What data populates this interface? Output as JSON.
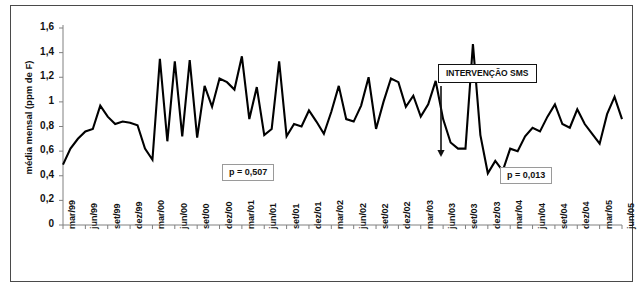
{
  "chart_data": {
    "type": "line",
    "title": "",
    "xlabel": "",
    "ylabel": "média mensal (ppm de F)",
    "ylim": [
      0,
      1.6
    ],
    "ytick_labels": [
      "0",
      "0,2",
      "0,4",
      "0,6",
      "0,8",
      "1",
      "1,2",
      "1,4",
      "1,6"
    ],
    "ytick_values": [
      0,
      0.2,
      0.4,
      0.6,
      0.8,
      1.0,
      1.2,
      1.4,
      1.6
    ],
    "grid": false,
    "legend": "none",
    "x_start": "mar/99",
    "x_end": "jun/05",
    "x_interval": "monthly",
    "tick_labels": [
      "mar/99",
      "jun/99",
      "set/99",
      "dez/99",
      "mar/00",
      "jun/00",
      "set/00",
      "dez/00",
      "mar/01",
      "jun/01",
      "set/01",
      "dez/01",
      "mar/02",
      "jun/02",
      "set/02",
      "dez/02",
      "mar/03",
      "jun/03",
      "set/03",
      "dez/03",
      "mar/04",
      "jun/04",
      "set/04",
      "dez/04",
      "mar/05",
      "jun/05"
    ],
    "series": [
      {
        "name": "média mensal (ppm de F)",
        "values": [
          0.49,
          0.62,
          0.7,
          0.76,
          0.78,
          0.97,
          0.88,
          0.82,
          0.84,
          0.83,
          0.81,
          0.62,
          0.53,
          1.35,
          0.68,
          1.33,
          0.72,
          1.34,
          0.71,
          1.13,
          0.96,
          1.19,
          1.16,
          1.1,
          1.37,
          0.86,
          1.12,
          0.73,
          0.78,
          1.33,
          0.72,
          0.82,
          0.8,
          0.93,
          0.84,
          0.74,
          0.92,
          1.13,
          0.86,
          0.84,
          0.97,
          1.2,
          0.78,
          1.0,
          1.19,
          1.16,
          0.96,
          1.05,
          0.88,
          0.98,
          1.17,
          0.86,
          0.67,
          0.62,
          0.62,
          1.47,
          0.73,
          0.42,
          0.52,
          0.44,
          0.62,
          0.6,
          0.72,
          0.79,
          0.76,
          0.88,
          0.98,
          0.82,
          0.79,
          0.94,
          0.82,
          0.74,
          0.66,
          0.9,
          1.04,
          0.86
        ]
      }
    ],
    "annotations": [
      {
        "name": "p-value-pre",
        "text": "p = 0,507"
      },
      {
        "name": "p-value-post",
        "text": "p = 0,013"
      },
      {
        "name": "intervention",
        "text": "INTERVENÇÃO SMS",
        "points_to": "set/03"
      }
    ],
    "colors": {
      "line": "#000000",
      "axis": "#808080",
      "frame": "#4a4a4a",
      "text": "#111111",
      "annotation_box_border": "#9a9a9a"
    }
  }
}
